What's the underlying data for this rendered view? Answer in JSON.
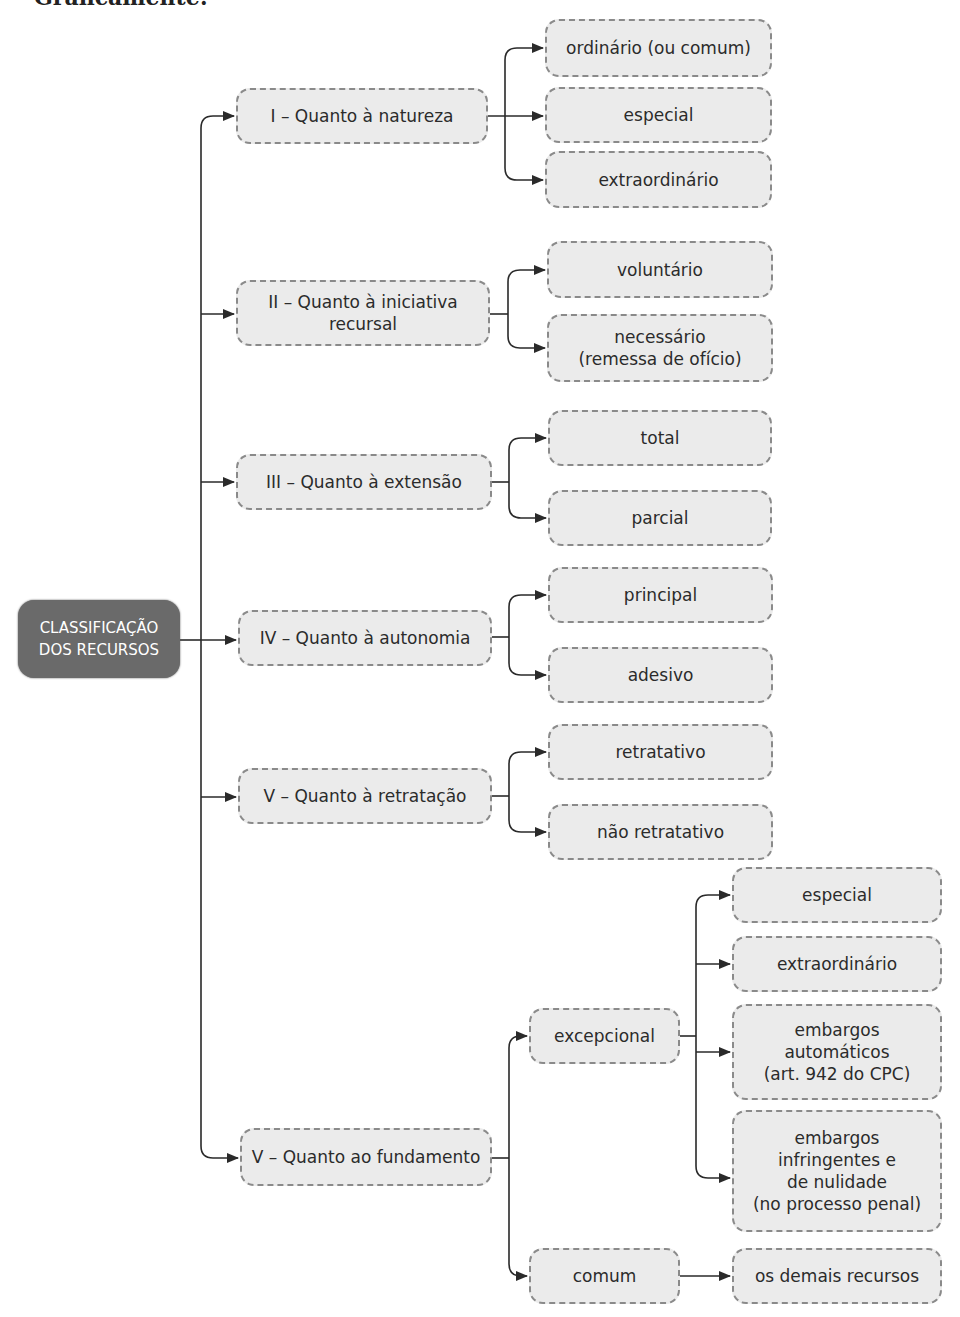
{
  "heading": "Graficamente:",
  "root": {
    "label": "CLASSIFICAÇÃO\nDOS RECURSOS",
    "color": "#6a6a6a"
  },
  "categories": [
    {
      "label": "I – Quanto à natureza",
      "children": [
        "ordinário (ou comum)",
        "especial",
        "extraordinário"
      ]
    },
    {
      "label": "II – Quanto à iniciativa\nrecursal",
      "children": [
        "voluntário",
        "necessário\n(remessa de ofício)"
      ]
    },
    {
      "label": "III – Quanto à extensão",
      "children": [
        "total",
        "parcial"
      ]
    },
    {
      "label": "IV – Quanto à autonomia",
      "children": [
        "principal",
        "adesivo"
      ]
    },
    {
      "label": "V – Quanto à retratação",
      "children": [
        "retratativo",
        "não retratativo"
      ]
    },
    {
      "label": "V – Quanto ao fundamento",
      "children": [
        {
          "label": "excepcional",
          "children": [
            "especial",
            "extraordinário",
            "embargos\nautomáticos\n(art. 942 do CPC)",
            "embargos\ninfringentes e\nde nulidade\n(no processo penal)"
          ]
        },
        {
          "label": "comum",
          "children": [
            "os demais recursos"
          ]
        }
      ]
    }
  ],
  "colors": {
    "box_fill": "#ebebeb",
    "box_border": "#8a8a8a",
    "line": "#2a2a2a"
  }
}
